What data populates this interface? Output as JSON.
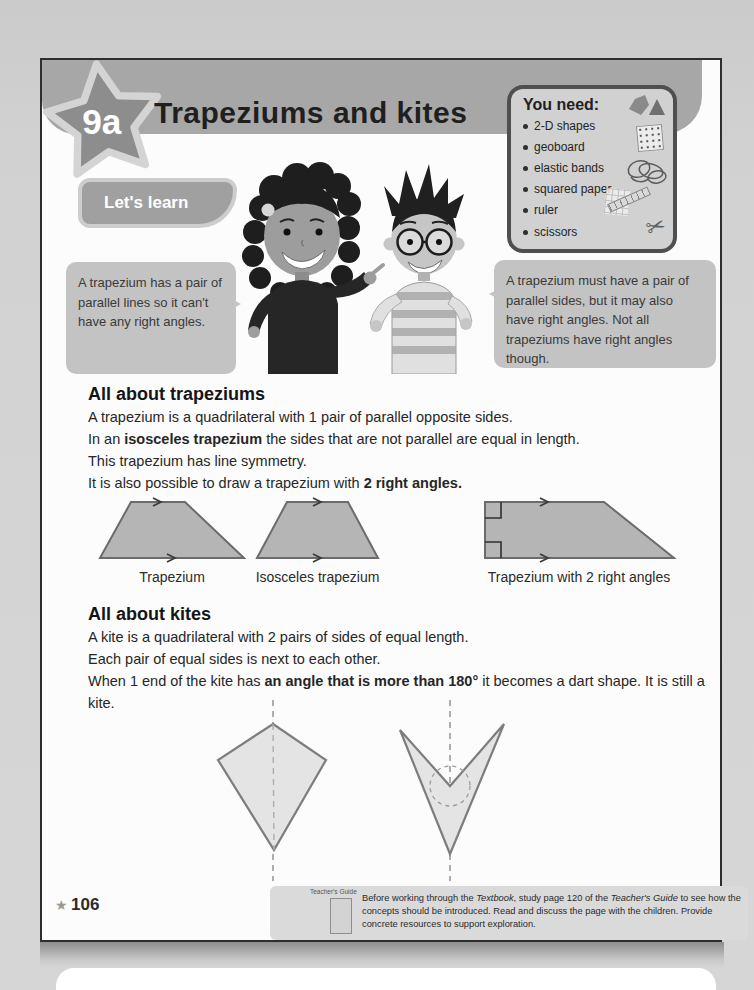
{
  "colors": {
    "outer_bg": "#d2d2d2",
    "page_bg": "#fcfcfc",
    "page_border": "#2e2e2e",
    "band": "#a7a7a7",
    "star_fill": "#8d8d8d",
    "star_outline": "#d4d4d4",
    "title_text": "#1f1f1f",
    "pill_bg": "#a0a0a0",
    "pill_border": "#cdcdcd",
    "bubble_bg": "#c3c3c3",
    "bubble_text": "#3a3a3a",
    "youneed_bg": "#d1d1d1",
    "youneed_border": "#4f4f4f",
    "body_text": "#262626",
    "trapezium_fill": "#b5b5b5",
    "trapezium_stroke": "#6b6b6b",
    "kite_fill": "#e4e4e4",
    "kite_stroke": "#7d7d7d",
    "note_bg": "#dadada"
  },
  "header": {
    "lesson_badge": "9a",
    "title": "Trapeziums and kites",
    "lets_learn": "Let's learn"
  },
  "you_need": {
    "title": "You need:",
    "items": [
      "2-D shapes",
      "geoboard",
      "elastic bands",
      "squared paper",
      "ruler",
      "scissors"
    ],
    "scissors_glyph": "✂"
  },
  "speech_bubbles": {
    "left": "A trapezium has a pair of parallel lines so it can't have any right angles.",
    "right": "A trapezium must have a pair of parallel sides, but it may also have right angles. Not all trapeziums have right angles though."
  },
  "trapeziums_section": {
    "heading": "All about trapeziums",
    "line1": "A trapezium is a quadrilateral with 1 pair of parallel opposite sides.",
    "line2_pre": "In an ",
    "line2_bold": "isosceles trapezium",
    "line2_post": " the sides that are not parallel are equal in length.",
    "line3": "This trapezium has line symmetry.",
    "line4_pre": "It is also possible to draw a trapezium with ",
    "line4_bold": "2 right angles.",
    "shape_labels": [
      "Trapezium",
      "Isosceles trapezium",
      "Trapezium with 2 right angles"
    ]
  },
  "kites_section": {
    "heading": "All about kites",
    "line1": "A kite is a quadrilateral with 2 pairs of sides of equal length.",
    "line2": "Each pair of equal sides is next to each other.",
    "line3_pre": "When 1 end of the kite has ",
    "line3_bold": "an angle that is more than 180°",
    "line3_post": " it becomes a dart shape. It is still a kite."
  },
  "footer": {
    "star_glyph": "★",
    "page_number": "106",
    "guide_label": "Teacher's Guide",
    "note_pre": "Before working through the ",
    "note_italic1": "Textbook",
    "note_mid": ", study page 120 of the ",
    "note_italic2": "Teacher's Guide",
    "note_post": " to see how the concepts should be introduced. Read and discuss the page with the children. Provide concrete resources to support exploration."
  }
}
